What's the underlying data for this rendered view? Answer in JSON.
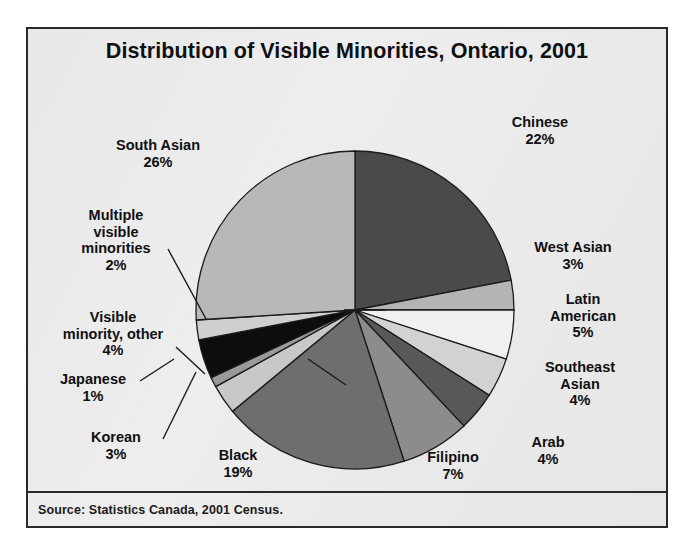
{
  "figure": {
    "title": "Distribution of Visible Minorities, Ontario, 2001",
    "source": "Source: Statistics Canada, 2001 Census."
  },
  "labels": {
    "south_asian": {
      "name": "South Asian",
      "pct": "26%"
    },
    "chinese": {
      "name": "Chinese",
      "pct": "22%"
    },
    "west_asian": {
      "name": "West Asian",
      "pct": "3%"
    },
    "latin_american": {
      "name": "Latin\nAmerican",
      "line1": "Latin",
      "line2": "American",
      "pct": "5%"
    },
    "southeast_asian": {
      "line1": "Southeast",
      "line2": "Asian",
      "pct": "4%"
    },
    "arab": {
      "name": "Arab",
      "pct": "4%"
    },
    "filipino": {
      "name": "Filipino",
      "pct": "7%"
    },
    "black": {
      "name": "Black",
      "pct": "19%"
    },
    "korean": {
      "name": "Korean",
      "pct": "3%"
    },
    "japanese": {
      "name": "Japanese",
      "pct": "1%"
    },
    "visible_minority_other": {
      "line1": "Visible",
      "line2": "minority, other",
      "pct": "4%"
    },
    "multiple_visible_minorities": {
      "line1": "Multiple",
      "line2": "visible",
      "line3": "minorities",
      "pct": "2%"
    }
  },
  "chart_data": {
    "type": "pie",
    "title": "Distribution of Visible Minorities, Ontario, 2001",
    "subtitle": "",
    "source": "Source: Statistics Canada, 2001 Census.",
    "units": "percent of visible minority population",
    "start_angle_deg": 0,
    "direction": "clockwise",
    "legend": "none (slices labelled directly with leader lines)",
    "grid": false,
    "labels": [
      "Chinese",
      "West Asian",
      "Latin American",
      "Southeast Asian",
      "Arab",
      "Filipino",
      "Black",
      "Korean",
      "Japanese",
      "Visible minority, other",
      "Multiple visible minorities",
      "South Asian"
    ],
    "values": [
      22,
      3,
      5,
      4,
      4,
      7,
      19,
      3,
      1,
      4,
      2,
      26
    ],
    "value_labels": [
      "22%",
      "3%",
      "5%",
      "4%",
      "4%",
      "7%",
      "19%",
      "3%",
      "1%",
      "4%",
      "2%",
      "26%"
    ],
    "colors": [
      "#4a4a4a",
      "#b4b4b4",
      "#f0f0f0",
      "#d2d2d2",
      "#585858",
      "#8c8c8c",
      "#6e6e6e",
      "#c8c8c8",
      "#9a9a9a",
      "#0d0d0d",
      "#cfcfcf",
      "#b8b8b8"
    ],
    "total": 100
  },
  "style": {
    "frame_border": "#2a2a2a",
    "background": "#f2f2f2",
    "text": "#101010",
    "slice_outline": "#1a1a1a"
  }
}
